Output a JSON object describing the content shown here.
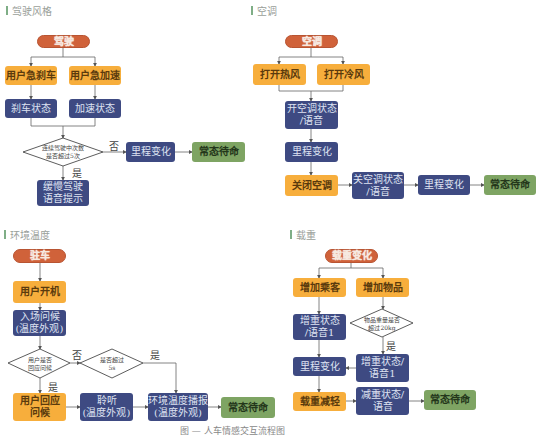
{
  "sections": {
    "driving": {
      "title": "驾驶风格",
      "start": "驾驶",
      "brake_action": "用户急刹车",
      "accel_action": "用户急加速",
      "brake_state": "刹车状态",
      "accel_state": "加速状态",
      "decision": "连续驾驶中次数\n是否超过5次",
      "no_label": "否",
      "yes_label": "是",
      "mileage": "里程变化",
      "standby": "常态待命",
      "voice_prompt": "缓慢驾驶\n语音提示"
    },
    "ac": {
      "title": "空调",
      "start": "空调",
      "hot_air": "打开热风",
      "cold_air": "打开冷风",
      "ac_on_state": "开空调状态\n/语音",
      "mileage1": "里程变化",
      "ac_off": "关闭空调",
      "ac_off_state": "关空调状态\n/语音",
      "mileage2": "里程变化",
      "standby": "常态待命"
    },
    "environment": {
      "title": "环境温度",
      "start": "驻车",
      "power_on": "用户开机",
      "greeting": "入场问候\n(温度外观)",
      "decision1": "用户是否\n回应问候",
      "no_label": "否",
      "decision2": "是否超过\n5s",
      "yes_label2": "是",
      "yes_label1": "是",
      "user_reply": "用户回应\n问候",
      "listen": "聆听\n(温度外观)",
      "temp_broadcast": "环境温度播报\n(温度外观)",
      "standby": "常态待命"
    },
    "load": {
      "title": "载重",
      "start": "载重变化",
      "add_passenger": "增加乘客",
      "add_item": "增加物品",
      "weight_state1": "增重状态\n/语音1",
      "decision": "物品重量是否\n超过20kg",
      "yes_label": "是",
      "mileage": "里程变化",
      "weight_state2": "增重状态/\n语音1",
      "load_reduce": "载重减轻",
      "reduce_state": "减重状态/\n语音",
      "standby": "常态待命"
    }
  },
  "caption": "图 — 人车情感交互流程图",
  "colors": {
    "start": "#d0623a",
    "action": "#f7ae3c",
    "state": "#3e4a82",
    "standby": "#7ea463",
    "accent": "#7fae86"
  }
}
